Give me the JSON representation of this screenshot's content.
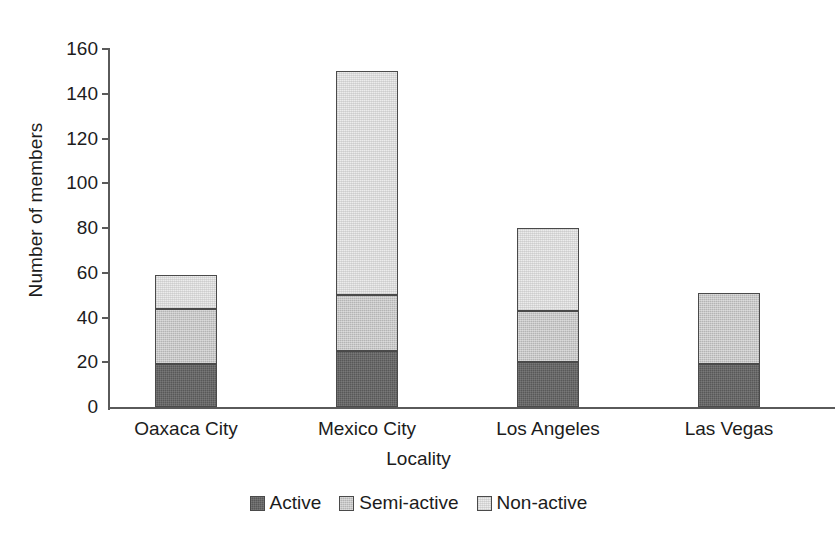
{
  "chart_data": {
    "type": "bar",
    "stacked": true,
    "title": "",
    "subtitle": "",
    "xlabel": "Locality",
    "ylabel": "Number of members",
    "categories": [
      "Oaxaca City",
      "Mexico City",
      "Los Angeles",
      "Las Vegas"
    ],
    "series": [
      {
        "name": "Active",
        "color": "#585858",
        "values": [
          19,
          25,
          20,
          19
        ]
      },
      {
        "name": "Semi-active",
        "color": "#b4b4b4",
        "values": [
          25,
          25,
          23,
          32
        ]
      },
      {
        "name": "Non-active",
        "color": "#ececec",
        "values": [
          15,
          100,
          37,
          0
        ]
      }
    ],
    "totals": [
      59,
      150,
      80,
      51
    ],
    "ylim": [
      0,
      160
    ],
    "ytick_step": 20,
    "ytick_labels": [
      "0",
      "20",
      "40",
      "60",
      "80",
      "100",
      "120",
      "140",
      "160"
    ],
    "grid": false,
    "legend_position": "bottom",
    "legend_entries": [
      "Active",
      "Semi-active",
      "Non-active"
    ],
    "axis_color": "#5a5a5a",
    "bar_border_color": "#4a4a4a",
    "background": "#ffffff"
  },
  "axes": {
    "y_title": "Number of members",
    "x_title": "Locality"
  }
}
